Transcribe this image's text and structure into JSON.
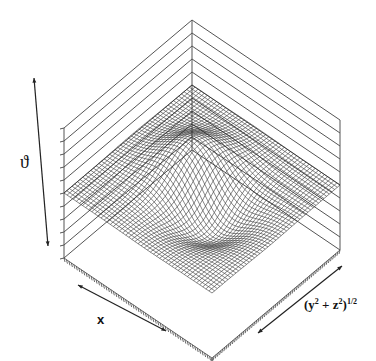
{
  "chart_data": {
    "type": "surface3d",
    "title": "",
    "axes": {
      "vertical": {
        "label": "ϑ",
        "ticks": 11,
        "tick_labels": []
      },
      "x": {
        "label": "x",
        "tick_labels": []
      },
      "radial": {
        "label": "(y² + z²)^1/2",
        "label_base": "(y",
        "label_sup1": "2",
        "label_mid": " + z",
        "label_sup2": "2",
        "label_close": ")",
        "label_sup3": "1/2",
        "tick_labels": []
      }
    },
    "grid": true,
    "legend": null,
    "surface": {
      "baseline": 0,
      "peak": {
        "position": "back-left of center",
        "relative_height": 1.0
      },
      "trough": {
        "position": "front-right of center",
        "relative_height": -0.75
      }
    }
  },
  "labels": {
    "vertical_axis": "ϑ",
    "x_axis": "x",
    "radial_base": "(y",
    "radial_sup1": "2",
    "radial_mid": " + z",
    "radial_sup2": "2",
    "radial_close": ")",
    "radial_sup3": "1/2"
  }
}
